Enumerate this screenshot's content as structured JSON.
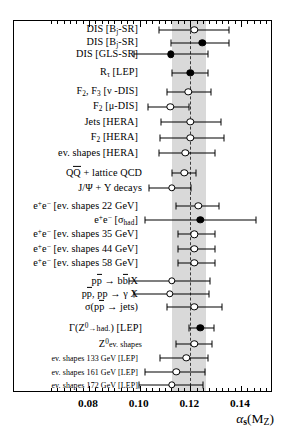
{
  "chart_data": {
    "type": "scatter",
    "title": "",
    "xlabel": "alpha_s (M_Z)",
    "ylabel": "",
    "xlim": [
      0.0653,
      0.1676
    ],
    "grid": false,
    "legend": null,
    "world_average": {
      "value": 0.1199,
      "band_low": 0.1128,
      "band_high": 0.126
    },
    "xticks_major": [
      0.08,
      0.1,
      0.12,
      0.14
    ],
    "xticklabels": [
      "0.08",
      "0.10",
      "0.12",
      "0.14"
    ],
    "categories": [
      "DIS [Bj-SR]",
      "DIS [Bj-SR]",
      "DIS [GLS-SR]",
      "R_tau [LEP]",
      "F2, F3 [nu -DIS]",
      "F2 [mu-DIS]",
      "Jets [HERA]",
      "F2 [HERA]",
      "ev. shapes [HERA]",
      "QQbar + lattice QCD",
      "J/Psi + Y decays",
      "e+e- [ev. shapes 22 GeV]",
      "e+e- [sigma_had]",
      "e+e- [ev. shapes 35 GeV]",
      "e+e- [ev. shapes 44 GeV]",
      "e+e- [ev. shapes 58 GeV]",
      "ppbar -> bbbar X",
      "ppbar, pp -> gamma X",
      "sigma(ppbar -> jets)",
      "Gamma(Z0->had.) [LEP]",
      "Z0 ev. shapes",
      "ev. shapes 133 GeV [LEP]",
      "ev. shapes 161 GeV [LEP]",
      "ev. shapes 172 GeV [LEP]"
    ],
    "points": [
      {
        "label": "DIS [Bj-SR]",
        "value": 0.1216,
        "err_low": 0.0138,
        "err_high": 0.0138,
        "marker": "open"
      },
      {
        "label": "DIS [Bj-SR]",
        "value": 0.1248,
        "err_low": 0.0126,
        "err_high": 0.0106,
        "marker": "filled"
      },
      {
        "label": "DIS [GLS-SR]",
        "value": 0.1122,
        "err_low": 0.0146,
        "err_high": 0.0146,
        "marker": "filled"
      },
      {
        "label": "R_tau [LEP]",
        "value": 0.12,
        "err_low": 0.0071,
        "err_high": 0.0071,
        "marker": "filled"
      },
      {
        "label": "F2, F3 [nu -DIS]",
        "value": 0.1192,
        "err_low": 0.0083,
        "err_high": 0.0091,
        "marker": "open"
      },
      {
        "label": "F2 [mu-DIS]",
        "value": 0.1121,
        "err_low": 0.0087,
        "err_high": 0.0075,
        "marker": "open"
      },
      {
        "label": "Jets [HERA]",
        "value": 0.12,
        "err_low": 0.0114,
        "err_high": 0.0122,
        "marker": "open"
      },
      {
        "label": "F2 [HERA]",
        "value": 0.12,
        "err_low": 0.0118,
        "err_high": 0.0134,
        "marker": "open"
      },
      {
        "label": "ev. shapes [HERA]",
        "value": 0.118,
        "err_low": 0.0102,
        "err_high": 0.0118,
        "marker": "open"
      },
      {
        "label": "QQbar + lattice QCD",
        "value": 0.1176,
        "err_low": 0.0047,
        "err_high": 0.0047,
        "marker": "open"
      },
      {
        "label": "J/Psi + Y decays",
        "value": 0.1128,
        "err_low": 0.0091,
        "err_high": 0.0075,
        "marker": "open"
      },
      {
        "label": "e+e- [ev. shapes 22 GeV]",
        "value": 0.1232,
        "err_low": 0.0087,
        "err_high": 0.0083,
        "marker": "open"
      },
      {
        "label": "e+e- [sigma_had]",
        "value": 0.124,
        "err_low": 0.0217,
        "err_high": 0.0221,
        "marker": "filled"
      },
      {
        "label": "e+e- [ev. shapes 35 GeV]",
        "value": 0.1216,
        "err_low": 0.0063,
        "err_high": 0.0083,
        "marker": "open"
      },
      {
        "label": "e+e- [ev. shapes 44 GeV]",
        "value": 0.1216,
        "err_low": 0.0063,
        "err_high": 0.0083,
        "marker": "open"
      },
      {
        "label": "e+e- [ev. shapes 58 GeV]",
        "value": 0.1216,
        "err_low": 0.0063,
        "err_high": 0.0083,
        "marker": "open"
      },
      {
        "label": "ppbar -> bbbar X",
        "value": 0.1128,
        "err_low": 0.017,
        "err_high": 0.015,
        "marker": "open"
      },
      {
        "label": "ppbar, pp -> gamma X",
        "value": 0.112,
        "err_low": 0.0142,
        "err_high": 0.0154,
        "marker": "open"
      },
      {
        "label": "sigma(ppbar -> jets)",
        "value": 0.1216,
        "err_low": 0.011,
        "err_high": 0.011,
        "marker": "open"
      },
      {
        "label": "Gamma(Z0->had.) [LEP]",
        "value": 0.124,
        "err_low": 0.0047,
        "err_high": 0.0055,
        "marker": "filled"
      },
      {
        "label": "Z0 ev. shapes",
        "value": 0.1216,
        "err_low": 0.0071,
        "err_high": 0.0071,
        "marker": "open"
      },
      {
        "label": "ev. shapes 133 GeV [LEP]",
        "value": 0.1184,
        "err_low": 0.0102,
        "err_high": 0.0087,
        "marker": "open"
      },
      {
        "label": "ev. shapes 161 GeV [LEP]",
        "value": 0.1144,
        "err_low": 0.0122,
        "err_high": 0.0114,
        "marker": "open"
      },
      {
        "label": "ev. shapes 172 GeV [LEP]",
        "value": 0.1128,
        "err_low": 0.013,
        "err_high": 0.0122,
        "marker": "open"
      }
    ]
  },
  "axis": {
    "title_alpha": "α",
    "title_sub": "s",
    "title_paren_open": "(M",
    "title_mz_sub": "Z",
    "title_paren_close": ")",
    "ticks": [
      "0.08",
      "0.10",
      "0.12",
      "0.14"
    ]
  },
  "labels": [
    {
      "id": "dis-bj-sr-1",
      "html": "DIS [B<span class=\"sub\">j</span>-SR]"
    },
    {
      "id": "dis-bj-sr-2",
      "html": "DIS [B<span class=\"sub\">j</span>-SR]"
    },
    {
      "id": "dis-gls-sr",
      "html": "DIS [GLS-SR]"
    },
    {
      "id": "r-tau-lep",
      "html": "R<span class=\"sub\">τ</span> [LEP]"
    },
    {
      "id": "f2-f3-nu-dis",
      "html": "F<span class=\"sub\">2</span>, F<span class=\"sub\">3</span> [ν -DIS]"
    },
    {
      "id": "f2-mu-dis",
      "html": "F<span class=\"sub\">2</span> [μ-DIS]"
    },
    {
      "id": "jets-hera",
      "html": "Jets [HERA]"
    },
    {
      "id": "f2-hera",
      "html": "F<span class=\"sub\">2</span> [HERA]"
    },
    {
      "id": "ev-shapes-hera",
      "html": "ev. shapes [HERA]"
    },
    {
      "id": "qqbar-lattice",
      "html": "Q<span class=\"ovl\">Q</span> + lattice QCD"
    },
    {
      "id": "jpsi-upsilon",
      "html": "J/Ψ + Y decays"
    },
    {
      "id": "ee-shapes-22",
      "html": "e<span class=\"sup\">+</span>e<span class=\"sup\">−</span> [ev. shapes 22 GeV]"
    },
    {
      "id": "ee-sigma-had",
      "html": "e<span class=\"sup\">+</span>e<span class=\"sup\">−</span> [σ<span class=\"sub\">had</span>]"
    },
    {
      "id": "ee-shapes-35",
      "html": "e<span class=\"sup\">+</span>e<span class=\"sup\">−</span> [ev. shapes 35 GeV]"
    },
    {
      "id": "ee-shapes-44",
      "html": "e<span class=\"sup\">+</span>e<span class=\"sup\">−</span> [ev. shapes 44 GeV]"
    },
    {
      "id": "ee-shapes-58",
      "html": "e<span class=\"sup\">+</span>e<span class=\"sup\">−</span> [ev. shapes 58 GeV]"
    },
    {
      "id": "ppbar-bbbar",
      "html": "p<span class=\"ovl\">p</span> → b<span class=\"ovl\">b</span> X"
    },
    {
      "id": "ppbar-gamma",
      "html": "p<span class=\"ovl\">p</span>, pp → γ X"
    },
    {
      "id": "ppbar-jets",
      "html": "σ(p<span class=\"ovl\">p</span> → jets)"
    },
    {
      "id": "gamma-z-had",
      "html": "Γ(Z<span class=\"sup\">0</span><span class=\"small\">→had.</span>) [LEP]"
    },
    {
      "id": "z0-ev-shapes",
      "html": "Z<span class=\"sup\">0</span><span class=\"small\">ev. shapes</span>"
    },
    {
      "id": "ev-shapes-133",
      "html": "<span class=\"small\">ev. shapes 133 GeV [LEP]</span>"
    },
    {
      "id": "ev-shapes-161",
      "html": "<span class=\"small\">ev. shapes 161 GeV [LEP]</span>"
    },
    {
      "id": "ev-shapes-172",
      "html": "<span class=\"small\">ev. shapes 172 GeV [LEP]</span>"
    }
  ],
  "geometry": {
    "row_y": [
      29,
      41.7,
      53.3,
      71.7,
      91,
      106,
      121,
      136.7,
      151.7,
      171.7,
      186.7,
      205,
      219,
      233.3,
      247.7,
      262,
      280,
      292.7,
      306,
      326.7,
      342.7,
      356.7,
      371,
      383.7
    ],
    "label_x": [
      139,
      139,
      139,
      139,
      139,
      139,
      139,
      139,
      139,
      143,
      143,
      139,
      139,
      139,
      139,
      139,
      139,
      139,
      139,
      143,
      143,
      139,
      139,
      139
    ],
    "frame": {
      "left": 13,
      "top": 20,
      "width": 259,
      "height": 372
    },
    "x_pixel_at": {
      "v1": 0.08,
      "px1": 88,
      "v2": 0.14,
      "px2": 240
    }
  }
}
